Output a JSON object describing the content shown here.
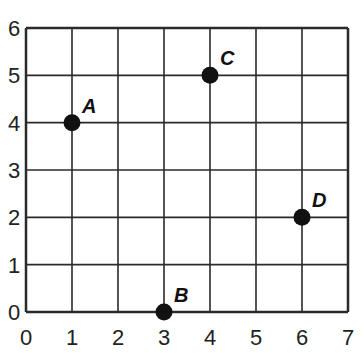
{
  "chart_data": {
    "type": "scatter",
    "title": "",
    "xlabel": "",
    "ylabel": "",
    "xlim": [
      0,
      7
    ],
    "ylim": [
      0,
      6
    ],
    "grid": true,
    "x_ticks": [
      "0",
      "1",
      "2",
      "3",
      "4",
      "5",
      "6",
      "7"
    ],
    "y_ticks": [
      "0",
      "1",
      "2",
      "3",
      "4",
      "5",
      "6"
    ],
    "points": [
      {
        "label": "A",
        "x": 1,
        "y": 4
      },
      {
        "label": "B",
        "x": 3,
        "y": 0
      },
      {
        "label": "C",
        "x": 4,
        "y": 5
      },
      {
        "label": "D",
        "x": 6,
        "y": 2
      }
    ]
  },
  "style": {
    "grid_color": "#2a2a2a",
    "point_color": "#111111",
    "background": "#ffffff"
  }
}
